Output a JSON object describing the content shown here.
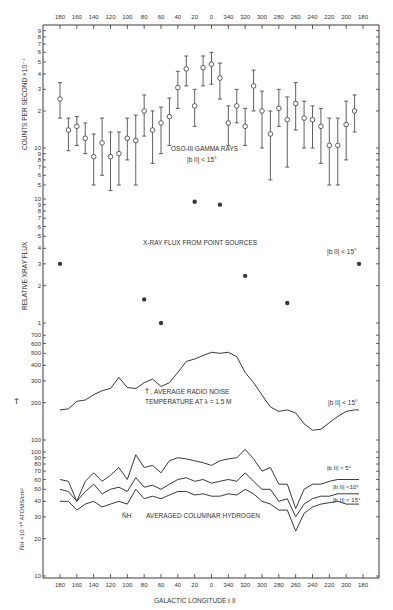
{
  "chart_data": [
    {
      "type": "scatter",
      "panel": "gamma",
      "title": "OSO-III GAMMA RAYS",
      "subtitle": "|b II| < 15°",
      "ylabel": "COUNTS PER SECOND ×10⁻⁴",
      "yscale": "log",
      "ytick_labels": [
        "9",
        "8",
        "7",
        "6",
        "5",
        "4",
        "3",
        "2",
        "10",
        "9",
        "8",
        "7",
        "6",
        "5"
      ],
      "ylim": [
        0.45,
        10
      ],
      "error_bars": true,
      "x": [
        180,
        170,
        160,
        150,
        140,
        130,
        120,
        110,
        100,
        90,
        80,
        70,
        60,
        50,
        40,
        30,
        20,
        10,
        0,
        350,
        340,
        330,
        320,
        310,
        300,
        290,
        280,
        270,
        260,
        250,
        240,
        230,
        220,
        210,
        200,
        190
      ],
      "values": [
        2.5,
        1.4,
        1.5,
        1.2,
        0.85,
        1.1,
        0.85,
        0.9,
        1.2,
        1.15,
        2.0,
        1.4,
        1.6,
        1.8,
        3.1,
        4.4,
        2.2,
        4.5,
        4.8,
        3.7,
        1.6,
        2.2,
        1.5,
        3.2,
        2.0,
        1.3,
        2.1,
        1.7,
        2.3,
        1.75,
        1.7,
        1.5,
        1.05,
        1.05,
        1.55,
        2.0
      ],
      "errors_low": [
        1.75,
        0.95,
        1.05,
        0.9,
        0.5,
        0.6,
        0.45,
        0.5,
        0.8,
        0.5,
        1.25,
        0.75,
        0.9,
        1.05,
        2.1,
        3.2,
        1.5,
        3.2,
        3.3,
        2.5,
        1.05,
        1.6,
        1.05,
        2.0,
        1.0,
        0.55,
        1.5,
        0.7,
        1.4,
        1.0,
        1.0,
        0.75,
        0.5,
        0.5,
        0.8,
        1.35
      ],
      "errors_high": [
        3.4,
        1.75,
        1.8,
        1.6,
        1.3,
        1.75,
        1.35,
        1.35,
        1.75,
        1.85,
        2.7,
        2.0,
        2.15,
        2.55,
        4.2,
        5.6,
        3.0,
        5.6,
        6.0,
        4.9,
        2.2,
        3.0,
        2.1,
        4.3,
        2.9,
        2.0,
        3.0,
        2.6,
        3.4,
        2.4,
        2.2,
        2.1,
        1.75,
        1.75,
        2.4,
        2.7
      ]
    },
    {
      "type": "scatter",
      "panel": "xray",
      "title": "X-RAY FLUX FROM POINT SOURCES",
      "subtitle": "|b II| < 15°",
      "ylabel": "RELATIVE XRAY FLUX",
      "yscale": "log",
      "ytick_labels": [
        "10",
        "9",
        "8",
        "7",
        "6",
        "5",
        "4",
        "3",
        "2",
        "1"
      ],
      "ylim": [
        1,
        10
      ],
      "x": [
        180,
        80,
        60,
        20,
        350,
        320,
        270,
        180
      ],
      "values": [
        3.0,
        1.55,
        1.0,
        9.5,
        9.0,
        2.4,
        1.45,
        3.0
      ]
    },
    {
      "type": "line",
      "panel": "radio",
      "title": "T̄ , AVERAGE RADIO NOISE TEMPERATURE AT λ=1.5M",
      "subtitle": "|b II| < 15°",
      "ylabel": "T̄",
      "yscale": "log",
      "ytick_labels": [
        "700",
        "600",
        "500",
        "400",
        "300",
        "200",
        "100"
      ],
      "ylim": [
        100,
        700
      ],
      "x": [
        180,
        170,
        160,
        150,
        140,
        130,
        120,
        110,
        100,
        90,
        80,
        70,
        60,
        50,
        40,
        30,
        20,
        10,
        0,
        350,
        340,
        330,
        320,
        310,
        300,
        290,
        280,
        270,
        260,
        250,
        240,
        230,
        220,
        210,
        200,
        190,
        180
      ],
      "values": [
        175,
        178,
        205,
        210,
        232,
        250,
        260,
        320,
        265,
        260,
        290,
        310,
        270,
        290,
        350,
        430,
        450,
        480,
        510,
        500,
        510,
        470,
        350,
        290,
        230,
        185,
        170,
        175,
        165,
        135,
        120,
        122,
        138,
        155,
        170,
        175,
        175
      ]
    },
    {
      "type": "line",
      "panel": "hydrogen",
      "title": "N̄H AVERAGED COLUMNAR HYDROGEN",
      "ylabel": "N̄H ×10⁻¹⁹ ATOMS/cm²",
      "yscale": "log",
      "ytick_labels": [
        "100",
        "90",
        "80",
        "70",
        "60",
        "50",
        "40",
        "30",
        "20",
        "10"
      ],
      "ylim": [
        10,
        100
      ],
      "x": [
        180,
        170,
        160,
        150,
        140,
        130,
        120,
        110,
        100,
        90,
        80,
        70,
        60,
        50,
        40,
        30,
        20,
        10,
        0,
        350,
        340,
        330,
        320,
        310,
        300,
        290,
        280,
        270,
        260,
        250,
        240,
        230,
        220,
        210,
        200,
        190,
        180
      ],
      "series": [
        {
          "name": "|b II| < 5°",
          "values": [
            60,
            58,
            40,
            58,
            68,
            58,
            65,
            75,
            60,
            95,
            75,
            78,
            68,
            85,
            90,
            88,
            85,
            82,
            78,
            85,
            88,
            90,
            105,
            88,
            70,
            75,
            55,
            55,
            35,
            50,
            55,
            55,
            58,
            60,
            60,
            60,
            60
          ]
        },
        {
          "name": "|b II| < 10°",
          "values": [
            50,
            48,
            40,
            48,
            55,
            46,
            50,
            52,
            48,
            62,
            52,
            54,
            50,
            55,
            60,
            62,
            58,
            60,
            56,
            58,
            60,
            58,
            68,
            58,
            50,
            50,
            40,
            42,
            30,
            38,
            42,
            44,
            44,
            46,
            46,
            46,
            46
          ]
        },
        {
          "name": "|b II| < 15°",
          "values": [
            40,
            40,
            34,
            38,
            40,
            36,
            38,
            40,
            38,
            50,
            42,
            44,
            42,
            45,
            48,
            48,
            45,
            46,
            44,
            44,
            46,
            45,
            50,
            46,
            40,
            38,
            34,
            34,
            23,
            32,
            36,
            38,
            39,
            40,
            38,
            38,
            38
          ]
        }
      ]
    }
  ],
  "axes": {
    "x_ticks_top": [
      "180",
      "160",
      "140",
      "120",
      "100",
      "80",
      "60",
      "40",
      "20",
      "0",
      "340",
      "320",
      "300",
      "280",
      "260",
      "240",
      "220",
      "200",
      "180"
    ],
    "x_ticks_bottom": [
      "180",
      "160",
      "140",
      "120",
      "100",
      "80",
      "60",
      "40",
      "20",
      "0",
      "340",
      "320",
      "300",
      "280",
      "260",
      "240",
      "220",
      "200",
      "180"
    ],
    "xlabel": "GALACTIC LONGITUDE ℓ II"
  },
  "labels": {
    "gamma_title": "OSO-III  GAMMA RAYS",
    "gamma_cond": "|b II|  < 15°",
    "gamma_ylabel": "COUNTS  PER  SECOND  ×10⁻⁴",
    "xray_title": "X-RAY FLUX  FROM POINT SOURCES",
    "xray_cond": "|b II| < 15°",
    "xray_ylabel": "RELATIVE  XRAY  FLUX",
    "radio_line1": "T̄ ,  AVERAGE  RADIO  NOISE",
    "radio_line2": "TEMPERATURE  AT   λ = 1.5 M",
    "radio_cond": "|b II| < 15°",
    "radio_ylabel": "T̄",
    "h_title": "AVERAGED  COLUMNAR  HYDROGEN",
    "h_symbol": "N̄H",
    "h_cond5": "|b II| < 5°",
    "h_cond10": "|b II| <10°",
    "h_cond15": "|b II| < 15°",
    "h_ylabel": "N̄H ×10⁻¹⁹ ATOMS/cm²",
    "xlabel": "GALACTIC  LONGITUDE  ℓ II"
  },
  "colors": {
    "ink": "#3a3a3a",
    "background": "#ffffff"
  }
}
